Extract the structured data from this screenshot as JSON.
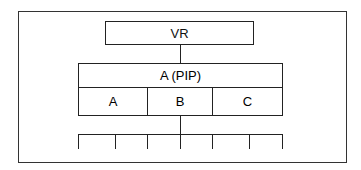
{
  "diagram": {
    "root": {
      "label": "VR"
    },
    "child": {
      "label": "A (PIP)",
      "parts": [
        "A",
        "B",
        "C"
      ]
    },
    "leaf_count": 7
  }
}
